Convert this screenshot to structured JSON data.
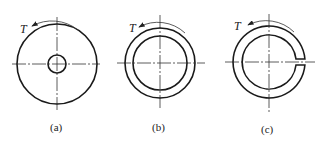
{
  "figure": {
    "panels": [
      {
        "id": "a",
        "label": "(a)",
        "torque_label": "T",
        "shape": "solid circle with small concentric hole (thick-walled)"
      },
      {
        "id": "b",
        "label": "(b)",
        "torque_label": "T",
        "shape": "thin-walled closed ring"
      },
      {
        "id": "c",
        "label": "(c)",
        "torque_label": "T",
        "shape": "thin-walled open (slit) ring"
      }
    ]
  }
}
